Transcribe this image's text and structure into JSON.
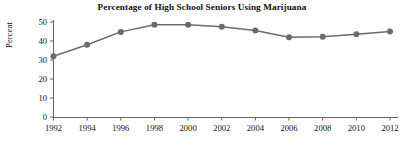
{
  "chart_data": {
    "type": "line",
    "title": "Percentage of High School Seniors Using Marijuana",
    "xlabel": "",
    "ylabel": "Percent",
    "categories": [
      1992,
      1994,
      1996,
      1998,
      2000,
      2002,
      2004,
      2006,
      2008,
      2010,
      2012
    ],
    "x_tick_labels": [
      "1992",
      "1994",
      "1996",
      "1998",
      "2000",
      "2002",
      "2004",
      "2006",
      "2008",
      "2010",
      "2012"
    ],
    "values": [
      32,
      38,
      44.8,
      48.6,
      48.5,
      47.5,
      45.5,
      42,
      42.3,
      43.6,
      45
    ],
    "y_tick_labels": [
      "0",
      "10",
      "20",
      "30",
      "40",
      "50"
    ],
    "y_ticks": [
      0,
      10,
      20,
      30,
      40,
      50
    ],
    "ylim": [
      0,
      50
    ],
    "xlim": [
      1992,
      2012
    ],
    "grid": false,
    "legend": false,
    "legend_position": "none",
    "series_color": "#6b6b6b",
    "marker": "circle",
    "marker_size": 3
  },
  "figure": {
    "background_color": "#ffffff",
    "axis_color": "#555555",
    "text_color": "#111111"
  }
}
